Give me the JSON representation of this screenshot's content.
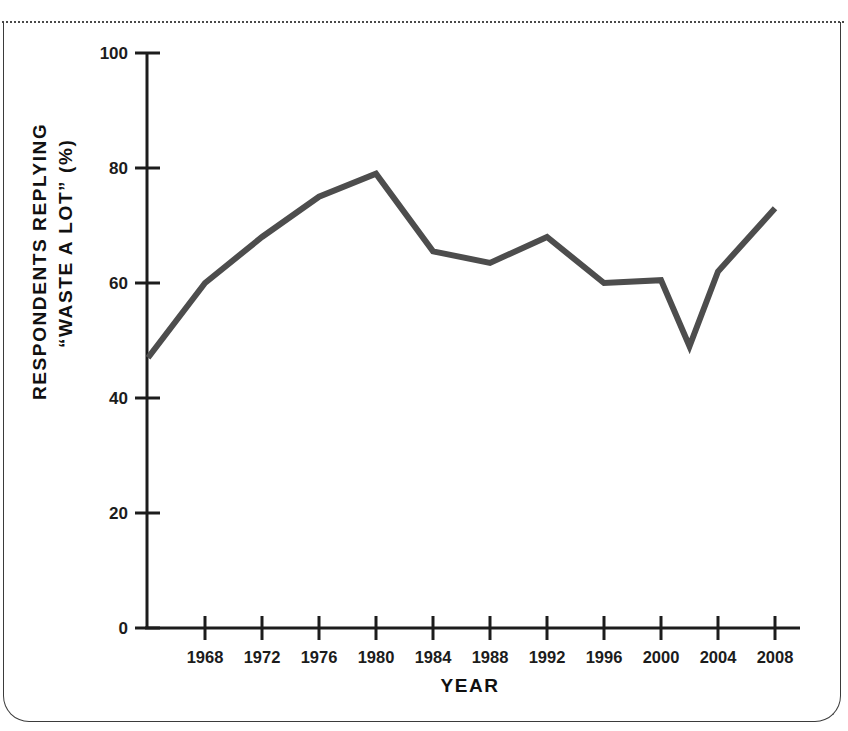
{
  "figure": {
    "frame": {
      "border_color": "#3b3b3b",
      "top_rule_style": "dotted"
    }
  },
  "chart_data": {
    "type": "line",
    "title": "",
    "xlabel": "YEAR",
    "ylabel_line1": "RESPONDENTS REPLYING",
    "ylabel_line2": "“WASTE A LOT” (%)",
    "xlim": [
      1964,
      2009
    ],
    "ylim": [
      0,
      100
    ],
    "grid": false,
    "legend": false,
    "line_color": "#4d4d4d",
    "line_width": 6,
    "yticks": [
      0,
      20,
      40,
      60,
      80,
      100
    ],
    "ytick_labels": [
      "0",
      "20",
      "40",
      "60",
      "80",
      "100"
    ],
    "xticks": [
      1968,
      1972,
      1976,
      1980,
      1984,
      1988,
      1992,
      1996,
      2000,
      2004,
      2008
    ],
    "xtick_labels": [
      "1968",
      "1972",
      "1976",
      "1980",
      "1984",
      "1988",
      "1992",
      "1996",
      "2000",
      "2004",
      "2008"
    ],
    "x": [
      1964,
      1968,
      1972,
      1976,
      1980,
      1984,
      1988,
      1992,
      1996,
      2000,
      2002,
      2004,
      2008
    ],
    "values": [
      47,
      60,
      68,
      75,
      79,
      65.5,
      63.5,
      68,
      60,
      60.5,
      49,
      62,
      73
    ],
    "series": [
      {
        "name": "Respondents replying government wastes a lot of money",
        "x": [
          1964,
          1968,
          1972,
          1976,
          1980,
          1984,
          1988,
          1992,
          1996,
          2000,
          2002,
          2004,
          2008
        ],
        "values": [
          47,
          60,
          68,
          75,
          79,
          65.5,
          63.5,
          68,
          60,
          60.5,
          49,
          62,
          73
        ]
      }
    ]
  }
}
